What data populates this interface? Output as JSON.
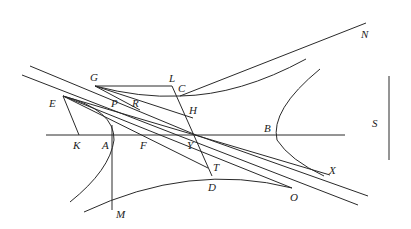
{
  "diagram": {
    "type": "geometric-construction",
    "labels": [
      {
        "id": "N",
        "text": "N",
        "x": 361,
        "y": 38
      },
      {
        "id": "G",
        "text": "G",
        "x": 90,
        "y": 81
      },
      {
        "id": "L",
        "text": "L",
        "x": 169,
        "y": 82
      },
      {
        "id": "C",
        "text": "C",
        "x": 178,
        "y": 92
      },
      {
        "id": "E",
        "text": "E",
        "x": 49,
        "y": 107
      },
      {
        "id": "P",
        "text": "P",
        "x": 111,
        "y": 107
      },
      {
        "id": "R",
        "text": "R",
        "x": 132,
        "y": 107
      },
      {
        "id": "H",
        "text": "H",
        "x": 189,
        "y": 114
      },
      {
        "id": "S",
        "text": "S",
        "x": 372,
        "y": 127
      },
      {
        "id": "B",
        "text": "B",
        "x": 264,
        "y": 132
      },
      {
        "id": "K",
        "text": "K",
        "x": 73,
        "y": 149
      },
      {
        "id": "A",
        "text": "A",
        "x": 102,
        "y": 149
      },
      {
        "id": "F",
        "text": "F",
        "x": 140,
        "y": 149
      },
      {
        "id": "Y",
        "text": "Y",
        "x": 187,
        "y": 149
      },
      {
        "id": "T",
        "text": "T",
        "x": 213,
        "y": 171
      },
      {
        "id": "X",
        "text": "X",
        "x": 329,
        "y": 174
      },
      {
        "id": "D",
        "text": "D",
        "x": 208,
        "y": 191
      },
      {
        "id": "O",
        "text": "O",
        "x": 290,
        "y": 201
      },
      {
        "id": "M",
        "text": "M",
        "x": 116,
        "y": 218
      }
    ]
  },
  "colors": {
    "stroke": "#2a2a2a",
    "label": "#222222",
    "background": "#ffffff"
  }
}
